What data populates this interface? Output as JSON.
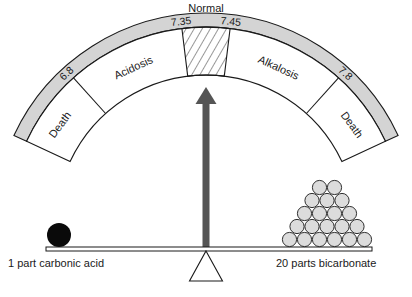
{
  "title": "Normal",
  "gauge": {
    "colors": {
      "band": "#d4d4d4",
      "stroke": "#1a1a1a",
      "zone_fill": "#ffffff",
      "arrow": "#555555"
    },
    "tick_values": [
      "6.8",
      "7.35",
      "7.45",
      "7.8"
    ],
    "zones": [
      {
        "label": "Death"
      },
      {
        "label": "Acidosis"
      },
      {
        "label": ""
      },
      {
        "label": "Alkalosis"
      },
      {
        "label": "Death"
      }
    ],
    "normal_label": "Normal"
  },
  "balance": {
    "left_label": "1 part carbonic acid",
    "right_label": "20 parts bicarbonate",
    "left_count": 1,
    "right_count": 20,
    "right_rows": [
      6,
      5,
      4,
      3,
      2
    ]
  }
}
